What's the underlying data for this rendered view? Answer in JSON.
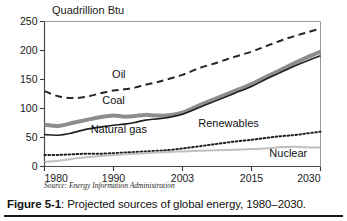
{
  "figure": {
    "caption_prefix": "Figure 5-1",
    "caption_separator": ": ",
    "caption_text": "Projected sources of global energy, 1980–2030.",
    "source_note": "Source: Energy Information Administration"
  },
  "chart_data": {
    "type": "line",
    "title": "",
    "subtitle": "",
    "xlabel": "",
    "ylabel": "Quadrillion Btu",
    "ylim": [
      0,
      250
    ],
    "xlim": [
      1980,
      2030
    ],
    "yticks": [
      0,
      50,
      100,
      150,
      200,
      250
    ],
    "ytick_labels": [
      "0",
      "50",
      "100",
      "150",
      "200",
      "250"
    ],
    "xticks": [
      1980,
      1990,
      2003,
      2015,
      2030
    ],
    "xtick_labels": [
      "1980",
      "1990",
      "2003",
      "2015",
      "2030"
    ],
    "grid": false,
    "legend_position": "inline-annotations",
    "x": [
      1980,
      1982,
      1984,
      1986,
      1988,
      1990,
      1992,
      1994,
      1996,
      1998,
      2000,
      2003,
      2006,
      2009,
      2012,
      2015,
      2018,
      2021,
      2024,
      2027,
      2030
    ],
    "series": [
      {
        "name": "Oil",
        "style": "dashed",
        "color": "#262626",
        "width": 2.0,
        "label_x": 1991,
        "label_y": 152,
        "values": [
          130,
          121,
          118,
          120,
          126,
          131,
          133,
          136,
          141,
          145,
          150,
          158,
          170,
          179,
          189,
          198,
          207,
          216,
          224,
          231,
          238
        ]
      },
      {
        "name": "Coal",
        "style": "solid",
        "color": "#8d8d8d",
        "width": 4.0,
        "label_x": 1990,
        "label_y": 107,
        "values": [
          72,
          70,
          75,
          80,
          85,
          88,
          86,
          87,
          89,
          88,
          88,
          93,
          106,
          118,
          130,
          142,
          154,
          165,
          177,
          188,
          198
        ]
      },
      {
        "name": "Natural gas",
        "style": "solid",
        "color": "#1f1f1f",
        "width": 1.6,
        "label_x": 1991,
        "label_y": 58,
        "values": [
          55,
          54,
          58,
          64,
          68,
          71,
          73,
          76,
          80,
          82,
          84,
          90,
          102,
          114,
          126,
          138,
          150,
          161,
          172,
          182,
          191
        ]
      },
      {
        "name": "Renewables",
        "style": "dotted",
        "color": "#1f1f1f",
        "width": 2.0,
        "label_x": 2011,
        "label_y": 68,
        "values": [
          20,
          20,
          21,
          22,
          22,
          23,
          24,
          25,
          26,
          27,
          28,
          31,
          35,
          39,
          43,
          46,
          49,
          52,
          54,
          57,
          60
        ]
      },
      {
        "name": "Nuclear",
        "style": "solid",
        "color": "#bfbfbf",
        "width": 2.0,
        "label_x": 2023,
        "label_y": 17,
        "values": [
          8,
          10,
          13,
          16,
          18,
          20,
          21,
          22,
          23,
          24,
          25,
          26,
          27,
          28,
          29,
          30,
          31,
          33,
          34,
          33,
          33
        ]
      }
    ]
  }
}
